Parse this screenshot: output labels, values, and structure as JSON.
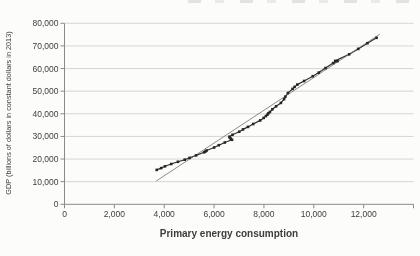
{
  "colors": {
    "background": "#fcfcfa",
    "gridline": "#c4c4c4",
    "axis": "#8a8a8a",
    "tick_text": "#3d3d3d",
    "series_line": "#2e2e2e",
    "marker": "#262626",
    "trend_line": "#707070"
  },
  "chart_data": {
    "type": "line",
    "title": "",
    "xlabel": "Primary energy consumption",
    "ylabel": "GDP (billions of dollars in constant dollars in 2013)",
    "xlim": [
      0,
      14000
    ],
    "ylim": [
      0,
      80000
    ],
    "x_ticks": [
      0,
      2000,
      4000,
      6000,
      8000,
      10000,
      12000
    ],
    "x_end_tick": 14000,
    "y_ticks": [
      0,
      10000,
      20000,
      30000,
      40000,
      50000,
      60000,
      70000,
      80000
    ],
    "grid": "horizontal",
    "legend_position": "none",
    "series": [
      {
        "name": "World GDP vs primary energy consumption (annual observations)",
        "style": "line-with-square-markers",
        "color": "#2e2e2e",
        "points": [
          [
            3700,
            15200
          ],
          [
            3880,
            16000
          ],
          [
            4030,
            16800
          ],
          [
            4280,
            17800
          ],
          [
            4550,
            18800
          ],
          [
            4820,
            19700
          ],
          [
            5020,
            20500
          ],
          [
            5280,
            21600
          ],
          [
            5600,
            23000
          ],
          [
            5660,
            23400
          ],
          [
            5700,
            23800
          ],
          [
            6000,
            25100
          ],
          [
            6190,
            26100
          ],
          [
            6430,
            27300
          ],
          [
            6720,
            28500
          ],
          [
            6670,
            29000
          ],
          [
            6630,
            29500
          ],
          [
            6620,
            29900
          ],
          [
            6740,
            30700
          ],
          [
            7010,
            32100
          ],
          [
            7160,
            33100
          ],
          [
            7360,
            34200
          ],
          [
            7570,
            35500
          ],
          [
            7850,
            37100
          ],
          [
            7990,
            38200
          ],
          [
            8080,
            39000
          ],
          [
            8140,
            39600
          ],
          [
            8180,
            40200
          ],
          [
            8240,
            40800
          ],
          [
            8340,
            42000
          ],
          [
            8490,
            43300
          ],
          [
            8680,
            44800
          ],
          [
            8810,
            46500
          ],
          [
            8860,
            47600
          ],
          [
            8960,
            49200
          ],
          [
            9150,
            51000
          ],
          [
            9230,
            51900
          ],
          [
            9340,
            52900
          ],
          [
            9610,
            54500
          ],
          [
            9960,
            56600
          ],
          [
            10200,
            58200
          ],
          [
            10470,
            60200
          ],
          [
            10780,
            62400
          ],
          [
            10950,
            63300
          ],
          [
            10860,
            63400
          ],
          [
            11420,
            66300
          ],
          [
            11780,
            68700
          ],
          [
            12150,
            71200
          ],
          [
            12520,
            73600
          ]
        ]
      },
      {
        "name": "Linear trend line",
        "style": "thin-straight-line",
        "color": "#707070",
        "points": [
          [
            3680,
            10300
          ],
          [
            12650,
            75200
          ]
        ]
      }
    ]
  }
}
